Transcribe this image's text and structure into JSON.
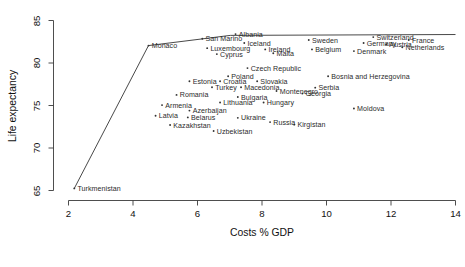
{
  "chart_data": {
    "type": "scatter",
    "title": "",
    "xlabel": "Costs % GDP",
    "ylabel": "Life expectancy",
    "xlim": [
      2,
      14
    ],
    "ylim": [
      65,
      85
    ],
    "xticks": [
      2,
      4,
      6,
      8,
      10,
      12,
      14
    ],
    "yticks": [
      65,
      70,
      75,
      80,
      85
    ],
    "grid": false,
    "legend": null,
    "point_color": "#333333",
    "line_color": "#333333",
    "frontier": {
      "name": "efficiency-frontier",
      "points": [
        [
          2.18,
          65.25
        ],
        [
          4.48,
          82.05
        ],
        [
          7.02,
          83.25
        ],
        [
          14.0,
          83.35
        ]
      ]
    },
    "points": [
      {
        "label": "Turkmenistan",
        "x": 2.18,
        "y": 65.25
      },
      {
        "label": "Monaco",
        "x": 4.48,
        "y": 82.05
      },
      {
        "label": "San Marino",
        "x": 6.15,
        "y": 82.85
      },
      {
        "label": "Albania",
        "x": 7.18,
        "y": 83.4
      },
      {
        "label": "Luxembourg",
        "x": 6.3,
        "y": 81.75
      },
      {
        "label": "Iceland",
        "x": 7.45,
        "y": 82.35
      },
      {
        "label": "Sweden",
        "x": 9.45,
        "y": 82.7
      },
      {
        "label": "Switzerland",
        "x": 11.45,
        "y": 83.05
      },
      {
        "label": "France",
        "x": 12.55,
        "y": 82.7
      },
      {
        "label": "Germany",
        "x": 11.15,
        "y": 82.35
      },
      {
        "label": "Austria",
        "x": 11.85,
        "y": 82.2
      },
      {
        "label": "Netherlands",
        "x": 12.35,
        "y": 81.85
      },
      {
        "label": "Ireland",
        "x": 8.1,
        "y": 81.6
      },
      {
        "label": "Belgium",
        "x": 9.55,
        "y": 81.6
      },
      {
        "label": "Denmark",
        "x": 10.85,
        "y": 81.4
      },
      {
        "label": "Cyprus",
        "x": 6.6,
        "y": 81.05
      },
      {
        "label": "Malta",
        "x": 8.35,
        "y": 81.15
      },
      {
        "label": "Czech Republic",
        "x": 7.55,
        "y": 79.4
      },
      {
        "label": "Poland",
        "x": 6.95,
        "y": 78.45
      },
      {
        "label": "Bosnia and Herzegovina",
        "x": 10.05,
        "y": 78.45
      },
      {
        "label": "Estonia",
        "x": 5.75,
        "y": 77.85
      },
      {
        "label": "Croatia",
        "x": 6.7,
        "y": 77.85
      },
      {
        "label": "Slovakia",
        "x": 7.85,
        "y": 77.85
      },
      {
        "label": "Turkey",
        "x": 6.45,
        "y": 77.15
      },
      {
        "label": "Macedonia",
        "x": 7.35,
        "y": 77.15
      },
      {
        "label": "Serbia",
        "x": 9.65,
        "y": 77.1
      },
      {
        "label": "Montenegro",
        "x": 8.45,
        "y": 76.7
      },
      {
        "label": "Georgia",
        "x": 9.25,
        "y": 76.4
      },
      {
        "label": "Romania",
        "x": 5.35,
        "y": 76.25
      },
      {
        "label": "Bulgaria",
        "x": 7.25,
        "y": 76.0
      },
      {
        "label": "Lithuania",
        "x": 6.7,
        "y": 75.35
      },
      {
        "label": "Hungary",
        "x": 8.05,
        "y": 75.35
      },
      {
        "label": "Armenia",
        "x": 4.9,
        "y": 75.05
      },
      {
        "label": "Moldova",
        "x": 10.85,
        "y": 74.65
      },
      {
        "label": "Azerbaijan",
        "x": 5.75,
        "y": 74.4
      },
      {
        "label": "Latvia",
        "x": 4.7,
        "y": 73.8
      },
      {
        "label": "Belarus",
        "x": 5.7,
        "y": 73.6
      },
      {
        "label": "Ukraine",
        "x": 7.25,
        "y": 73.55
      },
      {
        "label": "Russia",
        "x": 8.25,
        "y": 73.05
      },
      {
        "label": "Kirgistan",
        "x": 9.0,
        "y": 72.75
      },
      {
        "label": "Kazakhstan",
        "x": 5.15,
        "y": 72.7
      },
      {
        "label": "Uzbekistan",
        "x": 6.5,
        "y": 72.0
      }
    ]
  }
}
